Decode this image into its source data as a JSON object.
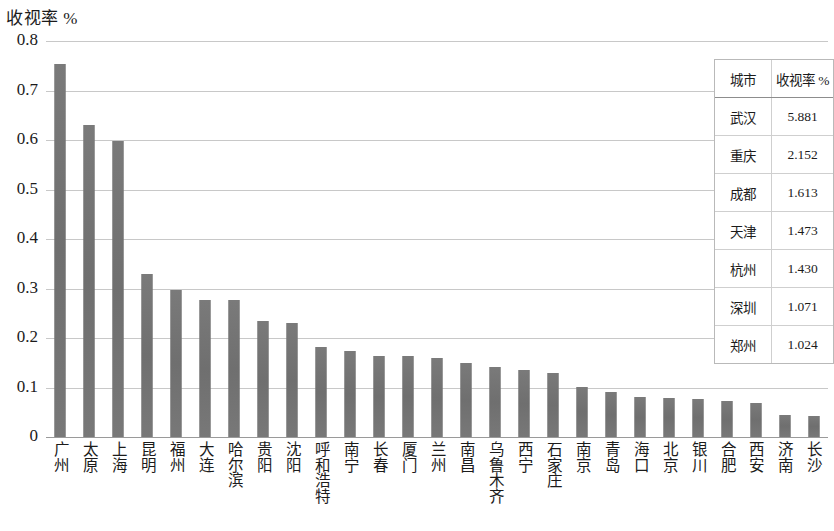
{
  "chart_data": {
    "type": "bar",
    "title": "收视率 %",
    "xlabel": "",
    "ylabel": "",
    "ylim": [
      0,
      0.8
    ],
    "ytick_labels": [
      "0.8",
      "0.7",
      "0.6",
      "0.5",
      "0.4",
      "0.3",
      "0.2",
      "0.1",
      "0"
    ],
    "ytick_values": [
      0.8,
      0.7,
      0.6,
      0.5,
      0.4,
      0.3,
      0.2,
      0.1,
      0
    ],
    "grid": true,
    "legend": "none",
    "categories": [
      "广州",
      "太原",
      "上海",
      "昆明",
      "福州",
      "大连",
      "哈尔滨",
      "贵阳",
      "沈阳",
      "呼和浩特",
      "南宁",
      "长春",
      "厦门",
      "兰州",
      "南昌",
      "乌鲁木齐",
      "西宁",
      "石家庄",
      "南京",
      "青岛",
      "海口",
      "北京",
      "银川",
      "合肥",
      "西安",
      "济南",
      "长沙"
    ],
    "values": [
      0.753,
      0.631,
      0.598,
      0.33,
      0.297,
      0.277,
      0.276,
      0.234,
      0.231,
      0.182,
      0.173,
      0.163,
      0.163,
      0.159,
      0.149,
      0.142,
      0.136,
      0.13,
      0.101,
      0.09,
      0.08,
      0.079,
      0.077,
      0.072,
      0.068,
      0.045,
      0.043
    ]
  },
  "inset_table": {
    "headers": [
      "城市",
      "收视率 %"
    ],
    "rows": [
      [
        "武汉",
        "5.881"
      ],
      [
        "重庆",
        "2.152"
      ],
      [
        "成都",
        "1.613"
      ],
      [
        "天津",
        "1.473"
      ],
      [
        "杭州",
        "1.430"
      ],
      [
        "深圳",
        "1.071"
      ],
      [
        "郑州",
        "1.024"
      ]
    ]
  },
  "colors": {
    "bar": "#767676",
    "gridline": "#c8c8c8",
    "axis": "#9a9a9a",
    "text": "#1b1b1b"
  }
}
